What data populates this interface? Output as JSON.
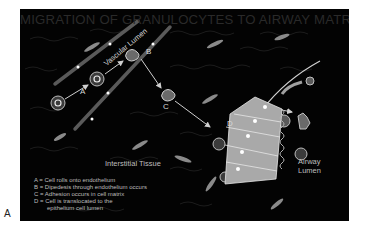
{
  "figure": {
    "panel_label": "A",
    "title": "MIGRATION OF GRANULOCYTES TO AIRWAY MATRIX",
    "regions": {
      "vascular_lumen": "Vascular Lumen",
      "interstitial_tissue": "Interstitial Tissue",
      "airway_lumen_line1": "Airway",
      "airway_lumen_line2": "Lumen"
    },
    "step_markers": [
      "A",
      "B",
      "C",
      "D"
    ],
    "legend": [
      {
        "key": "A",
        "text": "A  =  Cell rolls onto endothelium"
      },
      {
        "key": "B",
        "text": "B  =  Dipedesis through endothelium occurs"
      },
      {
        "key": "C",
        "text": "C  =  Adhesion occurs in cell matrix"
      },
      {
        "key": "D",
        "text": "D  =  Cell is translocated to the"
      },
      {
        "key": "D-cont",
        "text": "epithelium cell lumen"
      }
    ],
    "colors": {
      "background": "#030303",
      "title": "#2a2a2a",
      "epithelium": "#a9a9a9",
      "text": "#d8d8d8"
    }
  }
}
